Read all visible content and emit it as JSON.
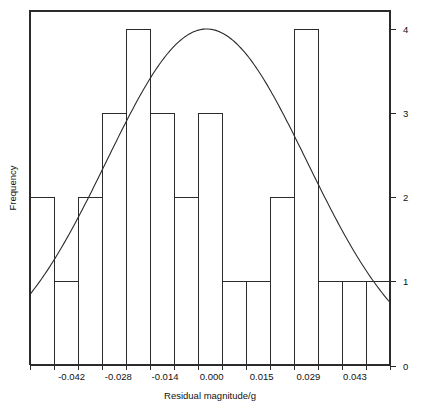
{
  "chart_data": {
    "type": "bar",
    "title": "",
    "subtitle": "",
    "xlabel": "Residual magnitude/g",
    "ylabel": "Frequency",
    "grid": false,
    "legend": null,
    "legend_position": "none",
    "xlim": [
      -0.0545,
      0.0535
    ],
    "ylim": [
      0,
      4
    ],
    "xtick_labels": [
      "-0.042",
      "-0.028",
      "-0.014",
      "0.000",
      "0.015",
      "0.029",
      "0.043"
    ],
    "xtick_values": [
      -0.042,
      -0.028,
      -0.014,
      0.0,
      0.015,
      0.029,
      0.043
    ],
    "ytick_labels": [
      "0",
      "1",
      "2",
      "3",
      "4"
    ],
    "ytick_values": [
      0,
      1,
      2,
      3,
      4
    ],
    "bin_width": 0.0072,
    "bin_edges": [
      -0.0545,
      -0.0473,
      -0.0401,
      -0.0329,
      -0.0257,
      -0.0185,
      -0.0113,
      -0.0041,
      0.0031,
      0.0103,
      0.0175,
      0.0247,
      0.0319,
      0.0391,
      0.0463,
      0.0535
    ],
    "categories": [
      "bin1",
      "bin2",
      "bin3",
      "bin4",
      "bin5",
      "bin6",
      "bin7",
      "bin8",
      "bin9",
      "bin10",
      "bin11",
      "bin12",
      "bin13",
      "bin14",
      "bin15"
    ],
    "values": [
      2,
      1,
      2,
      3,
      4,
      3,
      2,
      3,
      1,
      1,
      2,
      4,
      1,
      1,
      1
    ],
    "overlay_curve": {
      "type": "line",
      "name": "normal-fit",
      "mean": -0.0015,
      "peak_value": 4.0,
      "left_end_value": 0.85,
      "right_end_value": 0.55
    }
  },
  "axes": {
    "x_axis_title": "Residual magnitude/g",
    "y_axis_title": "Frequency",
    "y_ticks_side": "right"
  }
}
